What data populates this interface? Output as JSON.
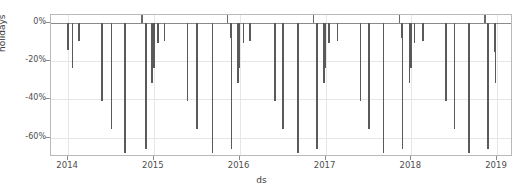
{
  "chart_data": {
    "type": "bar",
    "title": "",
    "xlabel": "ds",
    "ylabel": "holidays",
    "grid": true,
    "legend": null,
    "xlim": [
      "2013-10-20",
      "2019-03-10"
    ],
    "ylim": [
      -70,
      4
    ],
    "ytick_labels": [
      "0%",
      "-20%",
      "-40%",
      "-60%"
    ],
    "ytick_values": [
      0,
      -20,
      -40,
      -60
    ],
    "xtick_labels": [
      "2014",
      "2015",
      "2016",
      "2017",
      "2018",
      "2019"
    ],
    "xtick_values": [
      "2014-01-01",
      "2015-01-01",
      "2016-01-01",
      "2017-01-01",
      "2018-01-01",
      "2019-01-01"
    ],
    "bar_color": "#5a5a5a",
    "points": [
      {
        "x": "2014-01-01",
        "y": -14
      },
      {
        "x": "2014-01-20",
        "y": -23.5
      },
      {
        "x": "2014-02-17",
        "y": -9.5
      },
      {
        "x": "2014-05-26",
        "y": -41
      },
      {
        "x": "2014-07-04",
        "y": -55.5
      },
      {
        "x": "2014-09-01",
        "y": -68
      },
      {
        "x": "2014-11-11",
        "y": 4
      },
      {
        "x": "2014-11-27",
        "y": -7.5
      },
      {
        "x": "2014-11-28",
        "y": -66
      },
      {
        "x": "2014-12-24",
        "y": -15.5
      },
      {
        "x": "2014-12-25",
        "y": -31.5
      },
      {
        "x": "2014-12-26",
        "y": -13.5
      },
      {
        "x": "2015-01-01",
        "y": -23.5
      },
      {
        "x": "2015-01-19",
        "y": -10.5
      },
      {
        "x": "2015-02-16",
        "y": -9.5
      },
      {
        "x": "2015-05-25",
        "y": -41
      },
      {
        "x": "2015-07-03",
        "y": -55.5
      },
      {
        "x": "2015-09-07",
        "y": -68
      },
      {
        "x": "2015-11-11",
        "y": 4
      },
      {
        "x": "2015-11-26",
        "y": -8
      },
      {
        "x": "2015-11-27",
        "y": -66
      },
      {
        "x": "2015-12-24",
        "y": -15.5
      },
      {
        "x": "2015-12-25",
        "y": -31.5
      },
      {
        "x": "2015-12-26",
        "y": -13.5
      },
      {
        "x": "2016-01-01",
        "y": -23.5
      },
      {
        "x": "2016-01-18",
        "y": -10.5
      },
      {
        "x": "2016-02-15",
        "y": -9.5
      },
      {
        "x": "2016-05-30",
        "y": -41
      },
      {
        "x": "2016-07-04",
        "y": -55.5
      },
      {
        "x": "2016-09-05",
        "y": -68
      },
      {
        "x": "2016-11-11",
        "y": 4
      },
      {
        "x": "2016-11-24",
        "y": -8
      },
      {
        "x": "2016-11-25",
        "y": -66
      },
      {
        "x": "2016-12-24",
        "y": -15.5
      },
      {
        "x": "2016-12-25",
        "y": -31.5
      },
      {
        "x": "2016-12-26",
        "y": -13.5
      },
      {
        "x": "2017-01-01",
        "y": -23.5
      },
      {
        "x": "2017-01-16",
        "y": -10.5
      },
      {
        "x": "2017-02-20",
        "y": -9.5
      },
      {
        "x": "2017-05-29",
        "y": -41
      },
      {
        "x": "2017-07-04",
        "y": -55.5
      },
      {
        "x": "2017-09-04",
        "y": -68
      },
      {
        "x": "2017-11-11",
        "y": 4
      },
      {
        "x": "2017-11-23",
        "y": -8
      },
      {
        "x": "2017-11-24",
        "y": -66
      },
      {
        "x": "2017-12-24",
        "y": -15.5
      },
      {
        "x": "2017-12-25",
        "y": -31.5
      },
      {
        "x": "2017-12-26",
        "y": -13.5
      },
      {
        "x": "2018-01-01",
        "y": -23.5
      },
      {
        "x": "2018-01-15",
        "y": -10.5
      },
      {
        "x": "2018-02-19",
        "y": -9.5
      },
      {
        "x": "2018-05-28",
        "y": -41
      },
      {
        "x": "2018-07-04",
        "y": -55.5
      },
      {
        "x": "2018-09-03",
        "y": -68
      },
      {
        "x": "2018-11-11",
        "y": 4
      },
      {
        "x": "2018-11-22",
        "y": -8
      },
      {
        "x": "2018-11-23",
        "y": -66
      },
      {
        "x": "2018-12-24",
        "y": -15.5
      },
      {
        "x": "2018-12-25",
        "y": -31.5
      },
      {
        "x": "2018-12-26",
        "y": -13.5
      }
    ]
  }
}
